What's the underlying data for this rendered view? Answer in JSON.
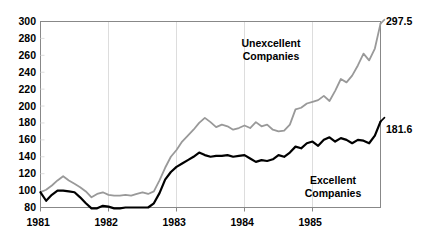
{
  "chart_data": {
    "type": "line",
    "title": "",
    "subtitle": "",
    "xlabel": "",
    "ylabel": "",
    "grid": "vertical-only, faint",
    "legend_position": "inline-annotation",
    "ylim": [
      80,
      300
    ],
    "yticks": [
      80,
      100,
      120,
      140,
      160,
      180,
      200,
      220,
      240,
      260,
      280,
      300
    ],
    "ytick_labels": [
      "80",
      "100",
      "120",
      "140",
      "160",
      "180",
      "200",
      "220",
      "240",
      "260",
      "280",
      "300"
    ],
    "xlim": [
      1981.0,
      1986.0
    ],
    "xticks": [
      1981,
      1982,
      1983,
      1984,
      1985
    ],
    "xtick_labels": [
      "1981",
      "1982",
      "1983",
      "1984",
      "1985"
    ],
    "x": [
      1981.0,
      1981.083,
      1981.167,
      1981.25,
      1981.333,
      1981.417,
      1981.5,
      1981.583,
      1981.667,
      1981.75,
      1981.833,
      1981.917,
      1982.0,
      1982.083,
      1982.167,
      1982.25,
      1982.333,
      1982.417,
      1982.5,
      1982.583,
      1982.667,
      1982.75,
      1982.833,
      1982.917,
      1983.0,
      1983.083,
      1983.167,
      1983.25,
      1983.333,
      1983.417,
      1983.5,
      1983.583,
      1983.667,
      1983.75,
      1983.833,
      1983.917,
      1984.0,
      1984.083,
      1984.167,
      1984.25,
      1984.333,
      1984.417,
      1984.5,
      1984.583,
      1984.667,
      1984.75,
      1984.833,
      1984.917,
      1985.0,
      1985.083,
      1985.167,
      1985.25,
      1985.333,
      1985.417,
      1985.5,
      1985.583,
      1985.667,
      1985.75,
      1985.833,
      1985.917,
      1986.0
    ],
    "series": [
      {
        "name": "Unexcellent Companies",
        "color": "#999999",
        "end_value": 297.5,
        "end_label": "297.5",
        "values": [
          98,
          101,
          106,
          112,
          117,
          112,
          108,
          104,
          99,
          92,
          96,
          98,
          95,
          94,
          94,
          95,
          94,
          96,
          98,
          96,
          99,
          112,
          127,
          140,
          148,
          158,
          165,
          172,
          180,
          186,
          181,
          175,
          178,
          176,
          172,
          174,
          177,
          174,
          181,
          176,
          178,
          172,
          170,
          171,
          178,
          196,
          198,
          203,
          205,
          207,
          212,
          206,
          218,
          232,
          228,
          236,
          248,
          262,
          254,
          268,
          297.5
        ]
      },
      {
        "name": "Excellent Companies",
        "color": "#000000",
        "end_value": 181.6,
        "end_label": "181.6",
        "values": [
          98,
          88,
          95,
          100,
          100,
          99,
          98,
          92,
          85,
          79,
          79,
          82,
          81,
          79,
          79,
          80,
          80,
          80,
          80,
          80,
          85,
          97,
          113,
          122,
          128,
          132,
          136,
          140,
          145,
          142,
          140,
          141,
          141,
          142,
          140,
          141,
          142,
          138,
          134,
          136,
          135,
          137,
          142,
          140,
          145,
          152,
          150,
          156,
          158,
          153,
          160,
          163,
          158,
          162,
          160,
          156,
          160,
          159,
          156,
          165,
          181.6
        ]
      }
    ],
    "annotations": [
      {
        "text": "Unexcellent Companies",
        "series": "Unexcellent Companies"
      },
      {
        "text": "Excellent Companies",
        "series": "Excellent Companies"
      }
    ]
  },
  "labels": {
    "unexcellent_line1": "Unexcellent",
    "unexcellent_line2": "Companies",
    "excellent_line1": "Excellent",
    "excellent_line2": "Companies",
    "endpoint_top": "297.5",
    "endpoint_bottom": "181.6"
  },
  "colors": {
    "unexcellent": "#999999",
    "excellent": "#000000",
    "axis": "#888888",
    "grid": "#dddddd",
    "text": "#000000",
    "background": "#ffffff"
  }
}
